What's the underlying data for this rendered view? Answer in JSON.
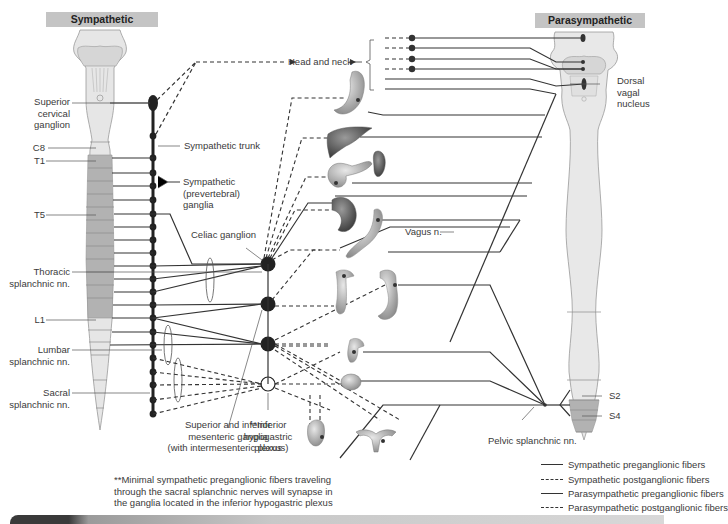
{
  "headers": {
    "sympathetic": "Sympathetic",
    "parasympathetic": "Parasympathetic"
  },
  "left_labels": {
    "superior_cervical_ganglion": [
      "Superior",
      "cervical",
      "ganglion"
    ],
    "c8": "C8",
    "t1": "T1",
    "t5": "T5",
    "thoracic_splanchnic": [
      "Thoracic",
      "splanchnic nn."
    ],
    "l1": "L1",
    "lumbar_splanchnic": [
      "Lumbar",
      "splanchnic nn."
    ],
    "sacral_splanchnic": [
      "Sacral",
      "splanchnic nn."
    ]
  },
  "center_labels": {
    "head_and_neck": "Head and neck",
    "sympathetic_trunk": "Sympathetic trunk",
    "prevertebral_ganglia": [
      "Sympathetic",
      "(prevertebral)",
      "ganglia"
    ],
    "celiac_ganglion": "Celiac ganglion",
    "mesenteric_ganglia": [
      "Superior and inferior",
      "mesenteric ganglia",
      "(with intermesenteric plexus)"
    ],
    "inferior_hypogastric": [
      "**Inferior",
      "hypogastric",
      "plexus"
    ],
    "vagus": "Vagus n.",
    "pelvic_splanchnic": "Pelvic splanchnic nn."
  },
  "right_labels": {
    "dorsal_vagal_nucleus": [
      "Dorsal",
      "vagal",
      "nucleus"
    ],
    "s2": "S2",
    "s4": "S4"
  },
  "footnote": [
    "**Minimal sympathetic preganglionic fibers traveling",
    "through the sacral splanchnic nerves will synapse in",
    "the ganglia located in the inferior hypogastric plexus"
  ],
  "legend": [
    {
      "label": "Sympathetic preganglionic fibers",
      "style": "solid"
    },
    {
      "label": "Sympathetic postganglionic fibers",
      "style": "dashed"
    },
    {
      "label": "Parasympathetic preganglionic fibers",
      "style": "solid"
    },
    {
      "label": "Parasympathetic postganglionic fibers",
      "style": "dashed"
    }
  ],
  "organs": [
    "eye-and-glands",
    "stomach",
    "liver",
    "spleen",
    "pancreas",
    "kidney",
    "small-intestine",
    "ascending-colon",
    "descending-colon",
    "rectum",
    "bladder",
    "male-genitalia",
    "uterus-and-ovaries"
  ],
  "colors": {
    "header_bg": "#c4c4c4",
    "spinal_cord_light": "#e4e4e4",
    "spinal_cord_dark": "#b0b0b0",
    "nerve_line": "#333333"
  }
}
